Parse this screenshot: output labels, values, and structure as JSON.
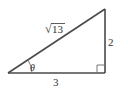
{
  "diagram": {
    "type": "right-triangle",
    "labels": {
      "hypotenuse": "13",
      "hypotenuse_radical": "√",
      "opposite": "2",
      "adjacent": "3",
      "angle": "θ"
    },
    "colors": {
      "stroke": "#4a4a4a",
      "text": "#333333",
      "background": "#ffffff"
    }
  }
}
